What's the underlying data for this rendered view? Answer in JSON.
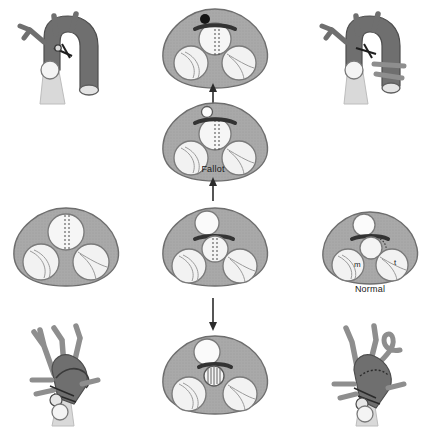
{
  "figure": {
    "type": "medical-anatomical-diagram",
    "background_color": "#ffffff"
  },
  "colors": {
    "myocardium_fill": "#a9a9a9",
    "myocardium_stroke": "#6e6e6e",
    "vessel_dark": "#6f6f6f",
    "vessel_mid": "#8e8e8e",
    "vessel_light": "#d4d4d4",
    "chamber_fill": "#f2f2f2",
    "chamber_stroke": "#7a7a7a",
    "marker_dark": "#1a1a1a",
    "arrow_color": "#2b2b2b",
    "label_color": "#1a1a1a"
  },
  "labels": [
    {
      "id": "fallot",
      "text": "Fallot",
      "x": 198,
      "y": 168
    },
    {
      "id": "normal",
      "text": "Normal",
      "x": 345,
      "y": 286
    }
  ],
  "valve_labels": [
    {
      "id": "mitral",
      "text": "m"
    },
    {
      "id": "tricuspid",
      "text": "t"
    }
  ],
  "arrows": [
    {
      "id": "arrow-up-upper",
      "direction": "up",
      "x": 213,
      "y1": 104,
      "y2": 84
    },
    {
      "id": "arrow-up-lower",
      "direction": "up",
      "x": 213,
      "y1": 196,
      "y2": 176
    },
    {
      "id": "arrow-down",
      "direction": "down",
      "x": 213,
      "y1": 300,
      "y2": 330
    }
  ],
  "panels": [
    {
      "id": "top-left-anatomy",
      "kind": "great-vessel-anatomy",
      "x": 10,
      "y": 8,
      "w": 110,
      "h": 100
    },
    {
      "id": "top-center-section",
      "kind": "valve-plane-section",
      "x": 155,
      "y": 6,
      "w": 120,
      "h": 85,
      "marker": "filled-dot",
      "aortic_dotted": true,
      "dark_bar": true
    },
    {
      "id": "top-right-anatomy",
      "kind": "great-vessel-anatomy",
      "x": 312,
      "y": 8,
      "w": 110,
      "h": 100
    },
    {
      "id": "upper-mid-center-section",
      "kind": "valve-plane-section",
      "x": 155,
      "y": 98,
      "w": 120,
      "h": 85,
      "marker": "open-dot",
      "aortic_dotted": true,
      "dark_bar": true
    },
    {
      "id": "mid-left-section",
      "kind": "valve-plane-section",
      "x": 8,
      "y": 205,
      "w": 120,
      "h": 85,
      "marker": "none",
      "aortic_dotted": true,
      "dark_bar": false
    },
    {
      "id": "mid-center-section",
      "kind": "valve-plane-section",
      "x": 155,
      "y": 205,
      "w": 120,
      "h": 85,
      "marker": "none",
      "aortic_dotted": true,
      "dark_bar": true,
      "offset_circle": true
    },
    {
      "id": "mid-right-section-normal",
      "kind": "valve-plane-section",
      "x": 312,
      "y": 205,
      "w": 110,
      "h": 80,
      "marker": "none",
      "aortic_dotted": false,
      "dark_bar": true,
      "normal": true
    },
    {
      "id": "bottom-left-anatomy",
      "kind": "great-vessel-anatomy",
      "x": 10,
      "y": 318,
      "w": 110,
      "h": 110
    },
    {
      "id": "bottom-center-section",
      "kind": "valve-plane-section",
      "x": 155,
      "y": 332,
      "w": 120,
      "h": 85,
      "marker": "striped-circle",
      "aortic_dotted": false,
      "dark_bar": true
    },
    {
      "id": "bottom-right-anatomy",
      "kind": "great-vessel-anatomy",
      "x": 312,
      "y": 318,
      "w": 110,
      "h": 110
    }
  ]
}
